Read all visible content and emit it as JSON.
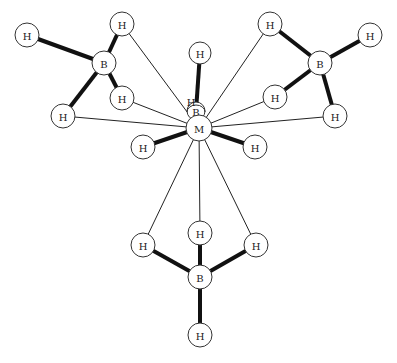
{
  "diagram": {
    "type": "molecular-structure",
    "center_atom": {
      "label": "M",
      "x": 199,
      "y": 128,
      "r": 13
    },
    "hidden_atoms": [
      {
        "id": "Bc",
        "label": "B",
        "x": 196,
        "y": 111,
        "r": 9
      },
      {
        "id": "Hc",
        "label": "H",
        "x": 191,
        "y": 118
      }
    ],
    "atoms": [
      {
        "id": "H_top",
        "label": "H",
        "x": 200,
        "y": 53,
        "r": 11
      },
      {
        "id": "B1",
        "label": "B",
        "x": 104,
        "y": 63,
        "r": 12
      },
      {
        "id": "H1a",
        "label": "H",
        "x": 27,
        "y": 35,
        "r": 12
      },
      {
        "id": "H1b",
        "label": "H",
        "x": 122,
        "y": 24,
        "r": 12
      },
      {
        "id": "H1c",
        "label": "H",
        "x": 122,
        "y": 98,
        "r": 12
      },
      {
        "id": "H1d",
        "label": "H",
        "x": 63,
        "y": 116,
        "r": 12
      },
      {
        "id": "B2",
        "label": "B",
        "x": 320,
        "y": 63,
        "r": 12
      },
      {
        "id": "H2a",
        "label": "H",
        "x": 270,
        "y": 24,
        "r": 12
      },
      {
        "id": "H2b",
        "label": "H",
        "x": 370,
        "y": 35,
        "r": 12
      },
      {
        "id": "H2c",
        "label": "H",
        "x": 275,
        "y": 97,
        "r": 12
      },
      {
        "id": "H2d",
        "label": "H",
        "x": 335,
        "y": 116,
        "r": 12
      },
      {
        "id": "H_left",
        "label": "H",
        "x": 143,
        "y": 147,
        "r": 12
      },
      {
        "id": "H_right",
        "label": "H",
        "x": 255,
        "y": 147,
        "r": 12
      },
      {
        "id": "B3",
        "label": "B",
        "x": 200,
        "y": 277,
        "r": 12
      },
      {
        "id": "H3a",
        "label": "H",
        "x": 143,
        "y": 245,
        "r": 12
      },
      {
        "id": "H3b",
        "label": "H",
        "x": 200,
        "y": 233,
        "r": 12
      },
      {
        "id": "H3c",
        "label": "H",
        "x": 256,
        "y": 245,
        "r": 12
      },
      {
        "id": "H3d",
        "label": "H",
        "x": 200,
        "y": 335,
        "r": 12
      }
    ],
    "bonds_thin": [
      [
        "M",
        "H1b"
      ],
      [
        "M",
        "H1c"
      ],
      [
        "M",
        "H1d"
      ],
      [
        "M",
        "H2a"
      ],
      [
        "M",
        "H2c"
      ],
      [
        "M",
        "H2d"
      ],
      [
        "M",
        "H3a"
      ],
      [
        "M",
        "H3b"
      ],
      [
        "M",
        "H3c"
      ]
    ],
    "bonds_thick": [
      [
        "B1",
        "H1a"
      ],
      [
        "B1",
        "H1b"
      ],
      [
        "B1",
        "H1c"
      ],
      [
        "B1",
        "H1d"
      ],
      [
        "B2",
        "H2a"
      ],
      [
        "B2",
        "H2b"
      ],
      [
        "B2",
        "H2c"
      ],
      [
        "B2",
        "H2d"
      ],
      [
        "B3",
        "H3a"
      ],
      [
        "B3",
        "H3b"
      ],
      [
        "B3",
        "H3c"
      ],
      [
        "B3",
        "H3d"
      ],
      [
        "Bc",
        "H_top"
      ],
      [
        "M",
        "H_left"
      ],
      [
        "M",
        "H_right"
      ]
    ]
  }
}
